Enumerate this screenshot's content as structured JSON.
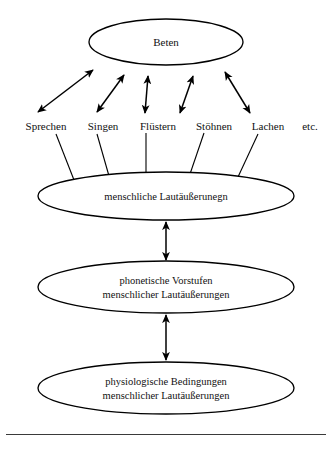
{
  "figure": {
    "language": "de",
    "baseline_rule": "horizontal-rule"
  },
  "top_node": {
    "label": "Beten",
    "cx": 166,
    "cy": 42,
    "rx": 77,
    "ry": 23
  },
  "terms": [
    {
      "label": "Sprechen",
      "x": 46,
      "y": 120
    },
    {
      "label": "Singen",
      "x": 103,
      "y": 120
    },
    {
      "label": "Flüstern",
      "x": 158,
      "y": 120
    },
    {
      "label": "Stöhnen",
      "x": 214,
      "y": 120
    },
    {
      "label": "Lachen",
      "x": 268,
      "y": 120
    },
    {
      "label": "etc.",
      "x": 310,
      "y": 120
    }
  ],
  "fan_arrows": [
    {
      "name": "arrow-sprechen",
      "x1": 38,
      "y1": 112,
      "x2": 93,
      "y2": 70
    },
    {
      "name": "arrow-singen",
      "x1": 97,
      "y1": 112,
      "x2": 124,
      "y2": 75
    },
    {
      "name": "arrow-fluestern",
      "x1": 145,
      "y1": 113,
      "x2": 148,
      "y2": 76
    },
    {
      "name": "arrow-stoehnen",
      "x1": 180,
      "y1": 113,
      "x2": 193,
      "y2": 76
    },
    {
      "name": "arrow-lachen",
      "x1": 250,
      "y1": 113,
      "x2": 225,
      "y2": 72
    }
  ],
  "stem_lines": [
    {
      "name": "stem-sprechen",
      "x1": 56,
      "y1": 134,
      "x2": 74,
      "y2": 180
    },
    {
      "name": "stem-singen",
      "x1": 97,
      "y1": 134,
      "x2": 109,
      "y2": 176
    },
    {
      "name": "stem-fluestern",
      "x1": 146,
      "y1": 133,
      "x2": 146,
      "y2": 173
    },
    {
      "name": "stem-stoehnen",
      "x1": 204,
      "y1": 133,
      "x2": 190,
      "y2": 174
    },
    {
      "name": "stem-lachen",
      "x1": 258,
      "y1": 134,
      "x2": 238,
      "y2": 177
    }
  ],
  "stack_nodes": [
    {
      "name": "ellipse-menschliche-lautaeusserungen",
      "lines": [
        "menschliche Lautäußerunegn"
      ],
      "cx": 166,
      "cy": 196,
      "rx": 128,
      "ry": 24
    },
    {
      "name": "ellipse-phonetische-vorstufen",
      "lines": [
        "phonetische Vorstufen",
        "menschlicher Lautäußerungen"
      ],
      "cx": 166,
      "cy": 287,
      "rx": 128,
      "ry": 26
    },
    {
      "name": "ellipse-physiologische-bedingungen",
      "lines": [
        "physiologische Bedingungen",
        "menschlicher Lautäußerungen"
      ],
      "cx": 166,
      "cy": 388,
      "rx": 128,
      "ry": 26
    }
  ],
  "link_arrows": [
    {
      "name": "link-arrow-upper",
      "x": 166,
      "y1": 222,
      "y2": 260
    },
    {
      "name": "link-arrow-lower",
      "x": 166,
      "y1": 315,
      "y2": 360
    }
  ],
  "colors": {
    "stroke": "#000000",
    "text": "#111111",
    "background": "#ffffff",
    "rule": "#3a3a3a"
  }
}
